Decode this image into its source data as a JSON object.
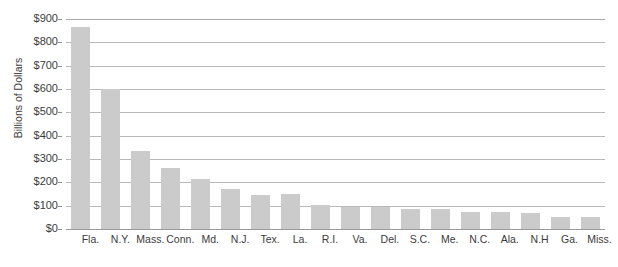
{
  "chart_data": {
    "type": "bar",
    "title": "",
    "xlabel": "",
    "ylabel": "Billions of Dollars",
    "ylim": [
      0,
      900
    ],
    "ytick_values": [
      0,
      100,
      200,
      300,
      400,
      500,
      600,
      700,
      800,
      900
    ],
    "ytick_labels": [
      "$0",
      "$100",
      "$200",
      "$300",
      "$400",
      "$500",
      "$600",
      "$700",
      "$800",
      "$900"
    ],
    "grid": true,
    "legend": false,
    "bar_color": "#cbcbcb",
    "gridline_color": "#b9b9b9",
    "axis_color": "#9a9a9a",
    "text_color": "#3c3c3c",
    "categories": [
      "Fla.",
      "N.Y.",
      "Mass.",
      "Conn.",
      "Md.",
      "N.J.",
      "Tex.",
      "La.",
      "R.I.",
      "Va.",
      "Del.",
      "S.C.",
      "Me.",
      "N.C.",
      "Ala.",
      "N.H",
      "Ga.",
      "Miss."
    ],
    "values": [
      865,
      600,
      335,
      260,
      215,
      170,
      145,
      150,
      105,
      95,
      95,
      85,
      85,
      75,
      75,
      70,
      50,
      50
    ]
  }
}
